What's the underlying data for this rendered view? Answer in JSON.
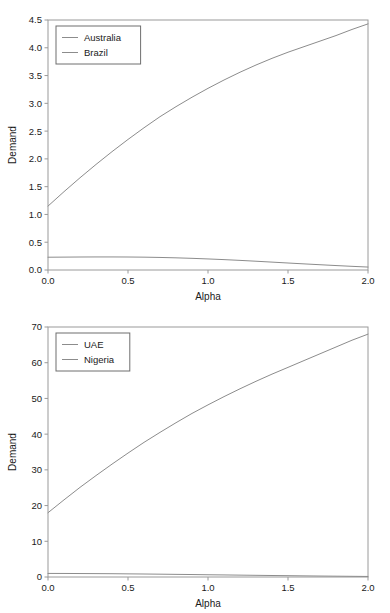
{
  "figure": {
    "background_color": "#ffffff",
    "panel_count": 2
  },
  "chart_data": [
    {
      "id": "top",
      "type": "line",
      "title": "",
      "xlabel": "Alpha",
      "ylabel": "Demand",
      "xlim": [
        0.0,
        2.0
      ],
      "ylim": [
        0.0,
        4.5
      ],
      "xticks": [
        0.0,
        0.5,
        1.0,
        1.5,
        2.0
      ],
      "xtick_labels": [
        "0.0",
        "0.5",
        "1.0",
        "1.5",
        "2.0"
      ],
      "yticks": [
        0.0,
        0.5,
        1.0,
        1.5,
        2.0,
        2.5,
        3.0,
        3.5,
        4.0,
        4.5
      ],
      "ytick_labels": [
        "0.0",
        "0.5",
        "1.0",
        "1.5",
        "2.0",
        "2.5",
        "3.0",
        "3.5",
        "4.0",
        "4.5"
      ],
      "grid": false,
      "legend_position": "upper left",
      "x": [
        0.0,
        0.1,
        0.2,
        0.3,
        0.4,
        0.5,
        0.6,
        0.7,
        0.8,
        0.9,
        1.0,
        1.1,
        1.2,
        1.3,
        1.4,
        1.5,
        1.6,
        1.7,
        1.8,
        1.9,
        2.0
      ],
      "series": [
        {
          "name": "Australia",
          "color": "#8c8c8c",
          "values": [
            1.15,
            1.41,
            1.66,
            1.9,
            2.13,
            2.35,
            2.56,
            2.76,
            2.94,
            3.11,
            3.27,
            3.42,
            3.56,
            3.69,
            3.81,
            3.92,
            4.02,
            4.12,
            4.22,
            4.33,
            4.43
          ]
        },
        {
          "name": "Brazil",
          "color": "#8c8c8c",
          "values": [
            0.23,
            0.232,
            0.234,
            0.235,
            0.235,
            0.234,
            0.231,
            0.226,
            0.219,
            0.21,
            0.199,
            0.187,
            0.173,
            0.158,
            0.142,
            0.126,
            0.11,
            0.095,
            0.08,
            0.066,
            0.053
          ]
        }
      ]
    },
    {
      "id": "bottom",
      "type": "line",
      "title": "",
      "xlabel": "Alpha",
      "ylabel": "Demand",
      "xlim": [
        0.0,
        2.0
      ],
      "ylim": [
        0.0,
        70.0
      ],
      "xticks": [
        0.0,
        0.5,
        1.0,
        1.5,
        2.0
      ],
      "xtick_labels": [
        "0.0",
        "0.5",
        "1.0",
        "1.5",
        "2.0"
      ],
      "yticks": [
        0,
        10,
        20,
        30,
        40,
        50,
        60,
        70
      ],
      "ytick_labels": [
        "0",
        "10",
        "20",
        "30",
        "40",
        "50",
        "60",
        "70"
      ],
      "grid": false,
      "legend_position": "upper left",
      "x": [
        0.0,
        0.1,
        0.2,
        0.3,
        0.4,
        0.5,
        0.6,
        0.7,
        0.8,
        0.9,
        1.0,
        1.1,
        1.2,
        1.3,
        1.4,
        1.5,
        1.6,
        1.7,
        1.8,
        1.9,
        2.0
      ],
      "series": [
        {
          "name": "UAE",
          "color": "#8c8c8c",
          "values": [
            18.0,
            21.6,
            25.1,
            28.4,
            31.6,
            34.7,
            37.7,
            40.5,
            43.2,
            45.8,
            48.2,
            50.5,
            52.7,
            54.8,
            56.8,
            58.7,
            60.6,
            62.5,
            64.4,
            66.3,
            68.0
          ]
        },
        {
          "name": "Nigeria",
          "color": "#8c8c8c",
          "values": [
            1.0,
            0.99,
            0.97,
            0.95,
            0.92,
            0.88,
            0.84,
            0.79,
            0.74,
            0.69,
            0.63,
            0.58,
            0.52,
            0.47,
            0.42,
            0.37,
            0.32,
            0.27,
            0.23,
            0.19,
            0.15
          ]
        }
      ]
    }
  ]
}
